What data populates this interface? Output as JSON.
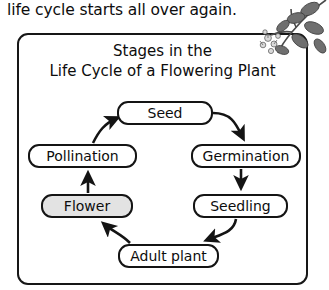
{
  "intro": {
    "text": "life cycle starts all over again."
  },
  "diagram": {
    "title_line1": "Stages in the",
    "title_line2": "Life Cycle of a Flowering Plant",
    "frame_color": "#171717",
    "highlight_color": "#e3e3e3",
    "stages": [
      {
        "id": "seed",
        "label": "Seed",
        "highlighted": false
      },
      {
        "id": "germination",
        "label": "Germination",
        "highlighted": false
      },
      {
        "id": "seedling",
        "label": "Seedling",
        "highlighted": false
      },
      {
        "id": "adult_plant",
        "label": "Adult plant",
        "highlighted": false
      },
      {
        "id": "flower",
        "label": "Flower",
        "highlighted": true
      },
      {
        "id": "pollination",
        "label": "Pollination",
        "highlighted": false
      }
    ],
    "arrows": [
      {
        "from": "seed",
        "to": "germination",
        "style": "curved"
      },
      {
        "from": "germination",
        "to": "seedling",
        "style": "straight"
      },
      {
        "from": "seedling",
        "to": "adult_plant",
        "style": "curved"
      },
      {
        "from": "adult_plant",
        "to": "flower",
        "style": "curved"
      },
      {
        "from": "flower",
        "to": "pollination",
        "style": "straight"
      },
      {
        "from": "pollination",
        "to": "seed",
        "style": "curved"
      }
    ],
    "illustration": "flowering-branch-illustration"
  }
}
